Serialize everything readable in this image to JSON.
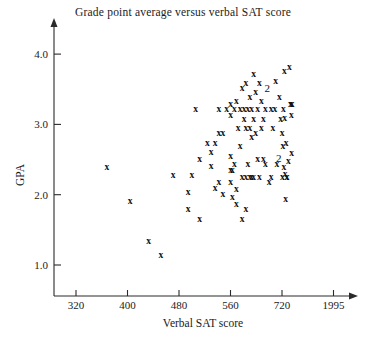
{
  "chart_data": {
    "type": "scatter",
    "title": "Grade point average versus verbal SAT score",
    "xlabel": "Verbal SAT score",
    "ylabel": "GPA",
    "grid": false,
    "legend": null,
    "xticks": [
      "320",
      "400",
      "480",
      "560",
      "720",
      "1995"
    ],
    "yticks": [
      "1.0",
      "2.0",
      "3.0",
      "4.0"
    ],
    "xlim": [
      320,
      2075
    ],
    "ylim": [
      0.85,
      4.3
    ],
    "marker": "x",
    "note": "Numeric labels '2' mark coincident pairs of observations",
    "points": [
      {
        "x": 368,
        "y": 2.4,
        "n": 1
      },
      {
        "x": 404,
        "y": 1.92,
        "n": 1
      },
      {
        "x": 433,
        "y": 1.35,
        "n": 1
      },
      {
        "x": 452,
        "y": 1.15,
        "n": 1
      },
      {
        "x": 471,
        "y": 2.28,
        "n": 1
      },
      {
        "x": 494,
        "y": 2.04,
        "n": 1
      },
      {
        "x": 494,
        "y": 1.8,
        "n": 1
      },
      {
        "x": 500,
        "y": 2.28,
        "n": 1
      },
      {
        "x": 506,
        "y": 3.22,
        "n": 1
      },
      {
        "x": 512,
        "y": 2.52,
        "n": 1
      },
      {
        "x": 512,
        "y": 1.66,
        "n": 1
      },
      {
        "x": 524,
        "y": 2.74,
        "n": 1
      },
      {
        "x": 530,
        "y": 2.62,
        "n": 1
      },
      {
        "x": 530,
        "y": 2.42,
        "n": 1
      },
      {
        "x": 536,
        "y": 2.74,
        "n": 1
      },
      {
        "x": 536,
        "y": 2.1,
        "n": 1
      },
      {
        "x": 542,
        "y": 3.22,
        "n": 1
      },
      {
        "x": 542,
        "y": 2.88,
        "n": 1
      },
      {
        "x": 542,
        "y": 2.18,
        "n": 1
      },
      {
        "x": 548,
        "y": 2.88,
        "n": 1
      },
      {
        "x": 548,
        "y": 2.02,
        "n": 1
      },
      {
        "x": 554,
        "y": 3.22,
        "n": 1
      },
      {
        "x": 560,
        "y": 3.3,
        "n": 1
      },
      {
        "x": 560,
        "y": 3.14,
        "n": 1
      },
      {
        "x": 560,
        "y": 2.56,
        "n": 1
      },
      {
        "x": 560,
        "y": 2.36,
        "n": 1
      },
      {
        "x": 560,
        "y": 2.18,
        "n": 1
      },
      {
        "x": 566,
        "y": 2.36,
        "n": 1
      },
      {
        "x": 566,
        "y": 1.98,
        "n": 1
      },
      {
        "x": 572,
        "y": 3.22,
        "n": 1
      },
      {
        "x": 572,
        "y": 2.44,
        "n": 1
      },
      {
        "x": 578,
        "y": 3.34,
        "n": 1
      },
      {
        "x": 578,
        "y": 2.08,
        "n": 1
      },
      {
        "x": 584,
        "y": 2.96,
        "n": 1
      },
      {
        "x": 590,
        "y": 3.22,
        "n": 1
      },
      {
        "x": 590,
        "y": 2.7,
        "n": 1
      },
      {
        "x": 596,
        "y": 3.52,
        "n": 1
      },
      {
        "x": 596,
        "y": 2.26,
        "n": 1
      },
      {
        "x": 602,
        "y": 3.22,
        "n": 1
      },
      {
        "x": 602,
        "y": 3.08,
        "n": 1
      },
      {
        "x": 608,
        "y": 3.6,
        "n": 1
      },
      {
        "x": 608,
        "y": 2.96,
        "n": 1
      },
      {
        "x": 608,
        "y": 2.26,
        "n": 1
      },
      {
        "x": 614,
        "y": 3.22,
        "n": 1
      },
      {
        "x": 614,
        "y": 2.44,
        "n": 1
      },
      {
        "x": 620,
        "y": 3.4,
        "n": 1
      },
      {
        "x": 620,
        "y": 2.96,
        "n": 1
      },
      {
        "x": 620,
        "y": 2.26,
        "n": 1
      },
      {
        "x": 626,
        "y": 3.22,
        "n": 1
      },
      {
        "x": 626,
        "y": 2.82,
        "n": 1
      },
      {
        "x": 626,
        "y": 2.26,
        "n": 1
      },
      {
        "x": 632,
        "y": 3.72,
        "n": 1
      },
      {
        "x": 632,
        "y": 3.08,
        "n": 1
      },
      {
        "x": 632,
        "y": 2.26,
        "n": 1
      },
      {
        "x": 638,
        "y": 3.46,
        "n": 1
      },
      {
        "x": 638,
        "y": 2.88,
        "n": 1
      },
      {
        "x": 644,
        "y": 3.22,
        "n": 1
      },
      {
        "x": 644,
        "y": 2.52,
        "n": 1
      },
      {
        "x": 650,
        "y": 3.6,
        "n": 1
      },
      {
        "x": 650,
        "y": 2.26,
        "n": 1
      },
      {
        "x": 656,
        "y": 3.34,
        "n": 1
      },
      {
        "x": 656,
        "y": 2.96,
        "n": 1
      },
      {
        "x": 662,
        "y": 3.08,
        "n": 1
      },
      {
        "x": 662,
        "y": 2.52,
        "n": 1
      },
      {
        "x": 668,
        "y": 3.22,
        "n": 1
      },
      {
        "x": 668,
        "y": 2.44,
        "n": 1
      },
      {
        "x": 674,
        "y": 3.52,
        "n": 2
      },
      {
        "x": 686,
        "y": 3.22,
        "n": 1
      },
      {
        "x": 692,
        "y": 2.96,
        "n": 1
      },
      {
        "x": 698,
        "y": 3.22,
        "n": 1
      },
      {
        "x": 704,
        "y": 2.44,
        "n": 1
      },
      {
        "x": 710,
        "y": 2.52,
        "n": 2
      },
      {
        "x": 716,
        "y": 3.08,
        "n": 1
      },
      {
        "x": 722,
        "y": 2.88,
        "n": 1
      },
      {
        "x": 728,
        "y": 2.26,
        "n": 1
      },
      {
        "x": 740,
        "y": 2.7,
        "n": 1
      },
      {
        "x": 752,
        "y": 3.22,
        "n": 1
      },
      {
        "x": 764,
        "y": 2.4,
        "n": 1
      },
      {
        "x": 776,
        "y": 3.76,
        "n": 1
      },
      {
        "x": 788,
        "y": 3.1,
        "n": 1
      },
      {
        "x": 800,
        "y": 2.3,
        "n": 1
      },
      {
        "x": 812,
        "y": 1.94,
        "n": 1
      },
      {
        "x": 824,
        "y": 2.74,
        "n": 1
      },
      {
        "x": 836,
        "y": 2.26,
        "n": 1
      },
      {
        "x": 848,
        "y": 2.26,
        "n": 1
      },
      {
        "x": 900,
        "y": 3.82,
        "n": 1
      },
      {
        "x": 930,
        "y": 3.3,
        "n": 1
      },
      {
        "x": 950,
        "y": 3.3,
        "n": 1
      },
      {
        "x": 968,
        "y": 3.3,
        "n": 1
      },
      {
        "x": 950,
        "y": 3.14,
        "n": 1
      },
      {
        "x": 960,
        "y": 2.6,
        "n": 1
      },
      {
        "x": 880,
        "y": 2.48,
        "n": 1
      },
      {
        "x": 712,
        "y": 3.4,
        "n": 1
      },
      {
        "x": 700,
        "y": 3.62,
        "n": 1
      },
      {
        "x": 686,
        "y": 2.26,
        "n": 1
      },
      {
        "x": 680,
        "y": 2.18,
        "n": 1
      },
      {
        "x": 596,
        "y": 1.66,
        "n": 1
      },
      {
        "x": 608,
        "y": 1.8,
        "n": 1
      },
      {
        "x": 578,
        "y": 1.88,
        "n": 1
      }
    ]
  }
}
